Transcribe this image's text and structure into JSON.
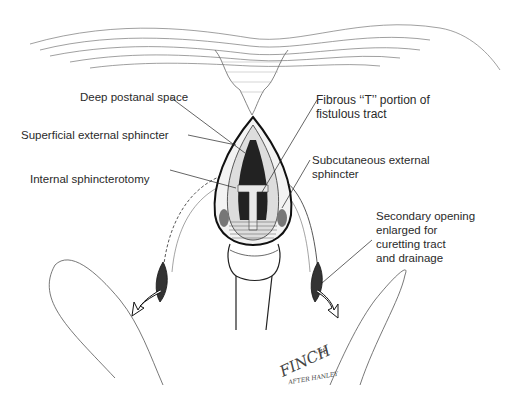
{
  "figure": {
    "labels": {
      "deep_postanal": "Deep postanal space",
      "fibrous_t_1": "Fibrous ‘‘T’’ portion of",
      "fibrous_t_2": "fistulous tract",
      "superficial": "Superficial external sphincter",
      "subcutaneous_1": "Subcutaneous external",
      "subcutaneous_2": "sphincter",
      "internal": "Internal sphincterotomy",
      "secondary_1": "Secondary opening",
      "secondary_2": "enlarged for",
      "secondary_3": "curetting tract",
      "secondary_4": "and drainage"
    },
    "signature": {
      "name": "FINCH",
      "year": "'78",
      "sub": "AFTER HANLEY"
    },
    "colors": {
      "ink": "#1a1a1a",
      "line": "#555555",
      "shade": "#888888"
    }
  }
}
